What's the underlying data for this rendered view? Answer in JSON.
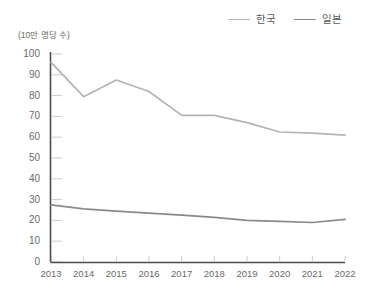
{
  "chart_data": {
    "type": "line",
    "title": "",
    "subtitle": "",
    "xlabel": "",
    "ylabel": "(10만 명당 수)",
    "unit_note": "(10만 명당 수)",
    "categories": [
      "2013",
      "2014",
      "2015",
      "2016",
      "2017",
      "2018",
      "2019",
      "2020",
      "2021",
      "2022"
    ],
    "x": [
      2013,
      2014,
      2015,
      2016,
      2017,
      2018,
      2019,
      2020,
      2021,
      2022
    ],
    "xlim": [
      2013,
      2022
    ],
    "ylim": [
      0,
      100
    ],
    "ytick_values": [
      0,
      10,
      20,
      30,
      40,
      50,
      60,
      70,
      80,
      90,
      100
    ],
    "ytick_labels": [
      "0",
      "10",
      "20",
      "30",
      "40",
      "50",
      "60",
      "70",
      "80",
      "90",
      "100"
    ],
    "grid": false,
    "legend_position": "top-right",
    "series": [
      {
        "name": "한국",
        "color": "#b4b4b4",
        "values": [
          96.0,
          79.5,
          87.5,
          82.0,
          70.5,
          70.5,
          67.0,
          62.5,
          62.0,
          61.0
        ]
      },
      {
        "name": "일본",
        "color": "#8a8a8a",
        "values": [
          27.5,
          25.5,
          24.5,
          23.5,
          22.5,
          21.5,
          20.0,
          19.5,
          19.0,
          20.5
        ]
      }
    ]
  },
  "legend": {
    "items": [
      {
        "label": "한국",
        "color": "#b4b4b4"
      },
      {
        "label": "일본",
        "color": "#8a8a8a"
      }
    ]
  },
  "axes": {
    "y_unit_label": "(10만 명당 수)",
    "axis_color": "#4d4d4d",
    "tick_color": "#cccccc"
  }
}
